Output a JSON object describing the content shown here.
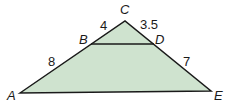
{
  "figure": {
    "type": "triangle-with-parallel-segment",
    "fill_color": "#cfe3cf",
    "stroke_color": "#1a1a1a",
    "vertices": {
      "A": {
        "label": "A",
        "x": 20,
        "y": 93
      },
      "C": {
        "label": "C",
        "x": 125,
        "y": 21
      },
      "E": {
        "label": "E",
        "x": 211,
        "y": 91
      },
      "B": {
        "label": "B",
        "x": 91,
        "y": 44
      },
      "D": {
        "label": "D",
        "x": 154,
        "y": 44
      }
    },
    "segment_lengths": {
      "BC": "4",
      "CD": "3.5",
      "AB": "8",
      "DE": "7"
    }
  }
}
